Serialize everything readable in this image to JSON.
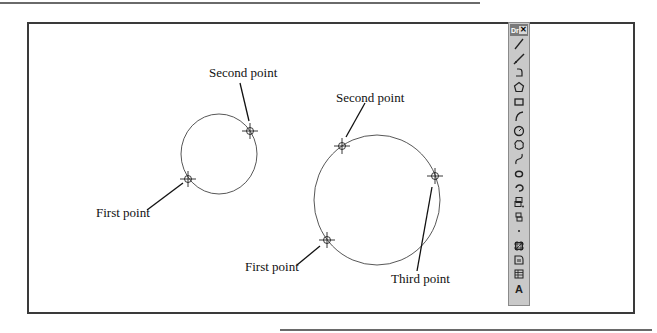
{
  "figure": {
    "small_circle": {
      "center": [
        219,
        154
      ],
      "rx": 38,
      "ry": 40,
      "labels": {
        "second": "Second point",
        "first": "First point"
      },
      "points": {
        "second": [
          250,
          131
        ],
        "first": [
          188,
          179
        ]
      }
    },
    "large_circle": {
      "center": [
        377,
        200
      ],
      "rx": 63,
      "ry": 65,
      "labels": {
        "second": "Second point",
        "third": "Third point",
        "first": "First point"
      },
      "points": {
        "second": [
          342,
          146
        ],
        "third": [
          435,
          176
        ],
        "first": [
          327,
          240
        ]
      }
    }
  },
  "toolbar": {
    "title_grip": "Dr",
    "close_glyph": "✕",
    "items": [
      {
        "name": "line-icon",
        "tooltip": "Line"
      },
      {
        "name": "construction-line-icon",
        "tooltip": "Construction Line"
      },
      {
        "name": "polyline-icon",
        "tooltip": "Polyline"
      },
      {
        "name": "polygon-icon",
        "tooltip": "Polygon"
      },
      {
        "name": "rectangle-icon",
        "tooltip": "Rectangle"
      },
      {
        "name": "arc-icon",
        "tooltip": "Arc"
      },
      {
        "name": "circle-icon",
        "tooltip": "Circle"
      },
      {
        "name": "revision-cloud-icon",
        "tooltip": "Revision Cloud"
      },
      {
        "name": "spline-icon",
        "tooltip": "Spline"
      },
      {
        "name": "ellipse-icon",
        "tooltip": "Ellipse"
      },
      {
        "name": "ellipse-arc-icon",
        "tooltip": "Ellipse Arc"
      },
      {
        "name": "insert-block-icon",
        "tooltip": "Insert Block"
      },
      {
        "name": "make-block-icon",
        "tooltip": "Make Block"
      },
      {
        "name": "point-icon",
        "tooltip": "Point"
      },
      {
        "name": "hatch-icon",
        "tooltip": "Hatch"
      },
      {
        "name": "region-icon",
        "tooltip": "Region"
      },
      {
        "name": "table-icon",
        "tooltip": "Table"
      },
      {
        "name": "multiline-text-icon",
        "tooltip": "Multiline Text",
        "glyph": "A"
      }
    ]
  }
}
